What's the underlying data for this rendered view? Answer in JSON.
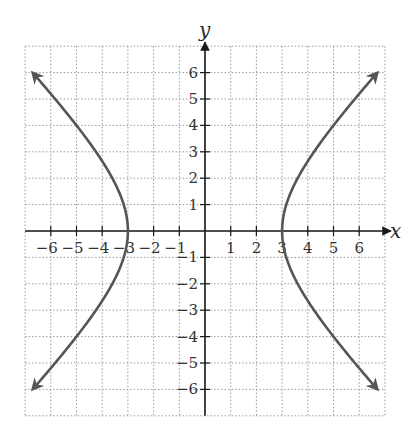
{
  "chart_data": {
    "type": "line",
    "title": "",
    "xlabel": "x",
    "ylabel": "y",
    "xlim": [
      -7,
      7
    ],
    "ylim": [
      -7,
      7
    ],
    "grid": true,
    "grid_style": "dotted",
    "x_ticks": [
      -6,
      -5,
      -4,
      -3,
      -2,
      -1,
      1,
      2,
      3,
      4,
      5,
      6
    ],
    "y_ticks": [
      -6,
      -5,
      -4,
      -3,
      -2,
      -1,
      1,
      2,
      3,
      4,
      5,
      6
    ],
    "x_tick_labels": [
      "−6",
      "−5",
      "−4",
      "−3",
      "−2",
      "−1",
      "1",
      "2",
      "3",
      "4",
      "5",
      "6"
    ],
    "y_tick_labels": [
      "−6",
      "−5",
      "−4",
      "−3",
      "−2",
      "−1",
      "1",
      "2",
      "3",
      "4",
      "5",
      "6"
    ],
    "equation": "x^2/9 - y^2/9 = 1",
    "series": [
      {
        "name": "right branch",
        "x": [
          6.71,
          6.0,
          5.0,
          4.24,
          3.61,
          3.16,
          3.0,
          3.16,
          3.61,
          4.24,
          5.0,
          6.0,
          6.71
        ],
        "y": [
          -6,
          -5.2,
          -4,
          -3,
          -2,
          -1,
          0,
          1,
          2,
          3,
          4,
          5.2,
          6
        ]
      },
      {
        "name": "left branch",
        "x": [
          -6.71,
          -6.0,
          -5.0,
          -4.24,
          -3.61,
          -3.16,
          -3.0,
          -3.16,
          -3.61,
          -4.24,
          -5.0,
          -6.0,
          -6.71
        ],
        "y": [
          -6,
          -5.2,
          -4,
          -3,
          -2,
          -1,
          0,
          1,
          2,
          3,
          4,
          5.2,
          6
        ]
      }
    ],
    "vertices": [
      [
        -3,
        0
      ],
      [
        3,
        0
      ]
    ],
    "arrows_at_ends": true,
    "colors": {
      "curve": "#555555",
      "axis": "#1a1a1a",
      "grid": "#9a9a9a"
    }
  }
}
